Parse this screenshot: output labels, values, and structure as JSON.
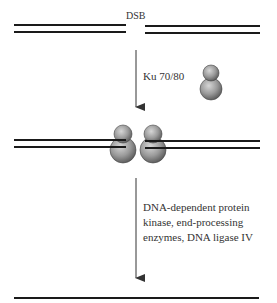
{
  "diagram": {
    "labels": {
      "break": "DSB",
      "step1": "Ku 70/80",
      "step2_lines": [
        "DNA-dependent protein",
        "kinase, end-processing",
        "enzymes, DNA ligase IV"
      ]
    },
    "stages": [
      {
        "name": "broken-dna",
        "description": "Double-stranded DNA with double-strand break"
      },
      {
        "name": "ku-bound-dna",
        "description": "Ku 70/80 heterodimers bound to both broken ends"
      },
      {
        "name": "repaired-dna",
        "description": "Rejoined DNA"
      }
    ],
    "colors": {
      "dna": "#1a1a1a",
      "arrow": "#333333",
      "protein_light": "#d0d0d0",
      "protein_dark": "#5a5a5a",
      "text": "#333333"
    }
  }
}
